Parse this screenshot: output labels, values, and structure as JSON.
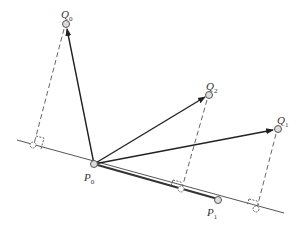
{
  "diagram": {
    "type": "vector-projection",
    "colors": {
      "line": "#555555",
      "arrow": "#222222",
      "dashed": "#666666",
      "point_fill": "#d8d8d8"
    },
    "points": {
      "P0": {
        "label": "P",
        "sub": "0",
        "x": 94,
        "y": 164
      },
      "P1": {
        "label": "P",
        "sub": "1",
        "x": 218,
        "y": 200
      },
      "Q0": {
        "label": "Q",
        "sub": "0",
        "x": 66,
        "y": 24
      },
      "Q1": {
        "label": "Q",
        "sub": "1",
        "x": 278,
        "y": 129
      },
      "Q2": {
        "label": "Q",
        "sub": "2",
        "x": 209,
        "y": 95
      }
    },
    "feet": [
      {
        "of": "Q0",
        "x": 33,
        "y": 145
      },
      {
        "of": "Q2",
        "x": 181,
        "y": 189
      },
      {
        "of": "Q1",
        "x": 256,
        "y": 209
      }
    ],
    "line": {
      "x1": 17,
      "y1": 140,
      "x2": 284,
      "y2": 213
    },
    "arrows": [
      "P0->Q0",
      "P0->Q2",
      "P0->Q1",
      "P0->P1 (thick segment)"
    ]
  }
}
